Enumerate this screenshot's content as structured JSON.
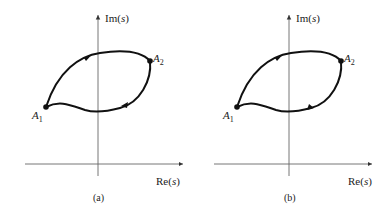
{
  "panels": [
    {
      "id": "a",
      "caption": "(a)",
      "y_axis_label": "Im(s)",
      "x_axis_label": "Re(s)",
      "points": {
        "start": "A1",
        "end": "A2"
      },
      "direction": "counterclockwise",
      "description": "Upper arc from A1 to A2 with arrow pointing right; lower arc from A2 back to A1 with arrow pointing left"
    },
    {
      "id": "b",
      "caption": "(b)",
      "y_axis_label": "Im(s)",
      "x_axis_label": "Re(s)",
      "points": {
        "start": "A1",
        "end": "A2"
      },
      "direction": "both-from-A1",
      "description": "Upper and lower arcs both run from A1 to A2 with arrows pointing right"
    }
  ],
  "labels": {
    "a1_main": "A",
    "a1_sub": "1",
    "a2_main": "A",
    "a2_sub": "2",
    "im_main": "Im",
    "re_main": "Re",
    "arg": "s"
  },
  "colors": {
    "curve": "#111111",
    "axis": "#555555",
    "text": "#222222"
  }
}
